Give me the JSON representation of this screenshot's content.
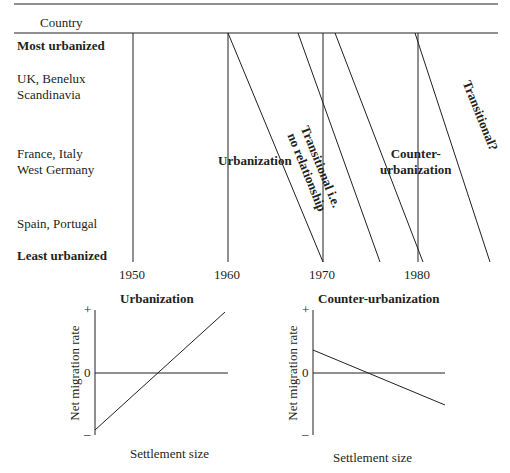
{
  "top_diagram": {
    "column_header": "Country",
    "rows": [
      {
        "label": "Most urbanized",
        "bold": true
      },
      {
        "label_lines": [
          "UK, Benelux",
          "Scandinavia"
        ],
        "bold": false
      },
      {
        "label_lines": [
          "France, Italy",
          "West Germany"
        ],
        "bold": false
      },
      {
        "label": "Spain, Portugal",
        "bold": false
      },
      {
        "label": "Least urbanized",
        "bold": true
      }
    ],
    "years": [
      "1950",
      "1960",
      "1970",
      "1980"
    ],
    "phases": {
      "urbanization": "Urbanization",
      "transitional_lines": [
        "Transitional i.e.",
        "no relationship"
      ],
      "counter_lines": [
        "Counter-",
        "urbanization"
      ],
      "transitional_q": "Transitional?"
    }
  },
  "bottom_left": {
    "title": "Urbanization",
    "ylabel": "Net migration rate",
    "xlabel": "Settlement size",
    "y_ticks": [
      "+",
      "0",
      "–"
    ]
  },
  "bottom_right": {
    "title": "Counter-urbanization",
    "ylabel": "Net migration rate",
    "xlabel": "Settlement size",
    "y_ticks": [
      "+",
      "0",
      "–"
    ]
  }
}
